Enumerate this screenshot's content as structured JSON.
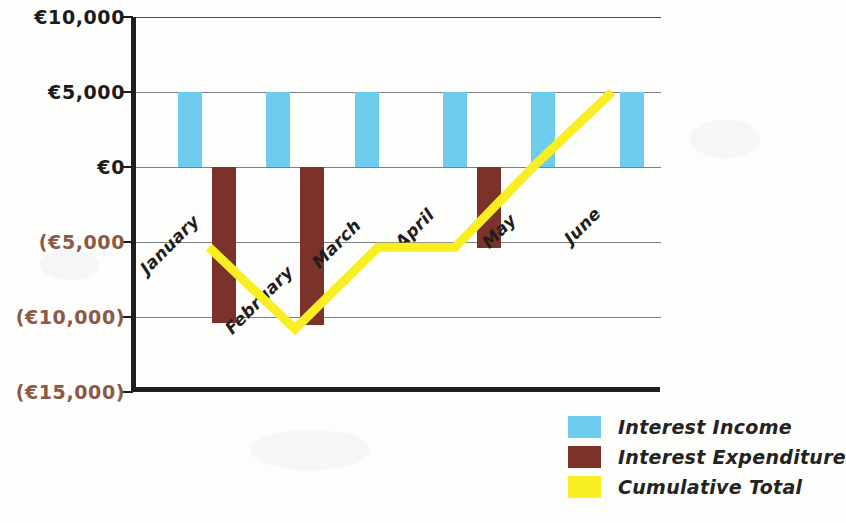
{
  "chart_data": {
    "type": "bar",
    "title": "",
    "subtitle": "",
    "xlabel": "",
    "ylabel": "",
    "categories": [
      "January",
      "February",
      "March",
      "April",
      "May",
      "June"
    ],
    "ylim": [
      -15000,
      10000
    ],
    "ytick_values": [
      10000,
      5000,
      0,
      -5000,
      -10000,
      -15000
    ],
    "ytick_labels": [
      "€10,000",
      "€5,000",
      "€0",
      "(€5,000",
      "(€10,000)",
      "(€15,000)"
    ],
    "grid": true,
    "legend_position": "bottom-right",
    "currency_symbol": "€",
    "series": [
      {
        "name": "Interest Income",
        "type": "bar",
        "color": "#6ecdef",
        "values": [
          5000,
          5000,
          5000,
          5000,
          5000,
          5000
        ]
      },
      {
        "name": "Interest Expenditure",
        "type": "bar",
        "color": "#7a322a",
        "values": [
          -10400,
          -10500,
          0,
          -5400,
          0,
          0
        ]
      },
      {
        "name": "Cumulative Total",
        "type": "line",
        "color": "#f8ee21",
        "values": [
          -5350,
          -10800,
          -5350,
          -5350,
          0,
          5000
        ]
      }
    ]
  },
  "legend": {
    "items": [
      {
        "label": "Interest Income",
        "color": "#6ecdef"
      },
      {
        "label": "Interest Expenditure",
        "color": "#7a322a"
      },
      {
        "label": "Cumulative Total",
        "color": "#f8ee21"
      }
    ]
  },
  "axis": {
    "y_labels": [
      {
        "text": "€10,000",
        "value": 10000,
        "negative": false
      },
      {
        "text": "€5,000",
        "value": 5000,
        "negative": false
      },
      {
        "text": "€0",
        "value": 0,
        "negative": false
      },
      {
        "text": "(€5,000",
        "value": -5000,
        "negative": true
      },
      {
        "text": "(€10,000)",
        "value": -10000,
        "negative": true
      },
      {
        "text": "(€15,000)",
        "value": -15000,
        "negative": true
      }
    ],
    "x_labels": [
      "January",
      "February",
      "March",
      "April",
      "May",
      "June"
    ]
  }
}
